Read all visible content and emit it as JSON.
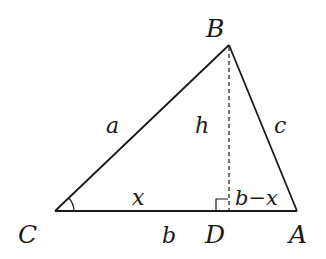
{
  "diagram": {
    "type": "triangle-with-altitude",
    "vertices": {
      "A": {
        "label": "A"
      },
      "B": {
        "label": "B"
      },
      "C": {
        "label": "C"
      },
      "D": {
        "label": "D"
      }
    },
    "sides": {
      "a": {
        "label": "a"
      },
      "b": {
        "label": "b"
      },
      "c": {
        "label": "c"
      },
      "h": {
        "label": "h"
      },
      "x": {
        "label": "x"
      },
      "b_minus_x": {
        "label": "b−x"
      }
    },
    "markers": {
      "angle_C": "arc",
      "right_angle_D": "square"
    },
    "colors": {
      "stroke": "#1a1a1a",
      "background": "#ffffff"
    }
  }
}
